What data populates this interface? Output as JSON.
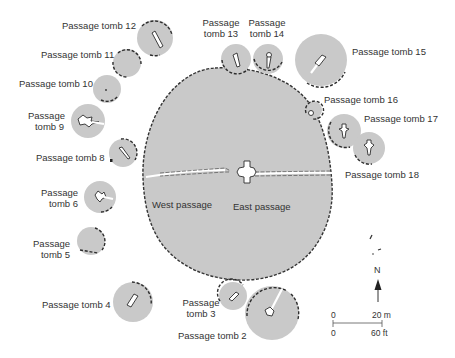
{
  "colors": {
    "fill": "#c9c9c9",
    "outline": "#2c2c2c",
    "text": "#333333",
    "background": "#ffffff"
  },
  "main_mound": {
    "west_passage_label": "West passage",
    "east_passage_label": "East passage"
  },
  "tombs": [
    {
      "id": 2,
      "label": "Passage tomb 2"
    },
    {
      "id": 3,
      "label_line1": "Passage",
      "label_line2": "tomb 3"
    },
    {
      "id": 4,
      "label": "Passage tomb 4"
    },
    {
      "id": 5,
      "label_line1": "Passage",
      "label_line2": "tomb 5"
    },
    {
      "id": 6,
      "label_line1": "Passage",
      "label_line2": "tomb 6"
    },
    {
      "id": 8,
      "label": "Passage tomb 8"
    },
    {
      "id": 9,
      "label_line1": "Passage",
      "label_line2": "tomb 9"
    },
    {
      "id": 10,
      "label": "Passage tomb 10"
    },
    {
      "id": 11,
      "label": "Passage tomb 11"
    },
    {
      "id": 12,
      "label": "Passage tomb 12"
    },
    {
      "id": 13,
      "label_line1": "Passage",
      "label_line2": "tomb 13"
    },
    {
      "id": 14,
      "label_line1": "Passage",
      "label_line2": "tomb 14"
    },
    {
      "id": 15,
      "label": "Passage tomb 15"
    },
    {
      "id": 16,
      "label": "Passage tomb 16"
    },
    {
      "id": 17,
      "label": "Passage tomb 17"
    },
    {
      "id": 18,
      "label": "Passage tomb 18"
    }
  ],
  "compass": {
    "north_label": "N",
    "icon": "north-arrow-icon"
  },
  "scale": {
    "metric_zero": "0",
    "metric_max": "20 m",
    "imperial_zero": "0",
    "imperial_max": "60 ft"
  }
}
